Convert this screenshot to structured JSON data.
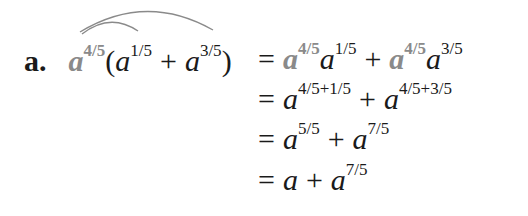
{
  "problem": {
    "label": "a.",
    "lhs": {
      "base": "a",
      "outer_exp": "4/5",
      "open_paren": "(",
      "term1_base": "a",
      "term1_exp": "1/5",
      "plus": "+",
      "term2_base": "a",
      "term2_exp": "3/5",
      "close_paren": ")"
    },
    "steps": [
      {
        "eq": "=",
        "parts": [
          {
            "base": "a",
            "exp": "4/5",
            "highlight": true
          },
          {
            "base": "a",
            "exp": "1/5"
          },
          {
            "op": "+"
          },
          {
            "base": "a",
            "exp": "4/5",
            "highlight": true
          },
          {
            "base": "a",
            "exp": "3/5"
          }
        ]
      },
      {
        "eq": "=",
        "parts": [
          {
            "base": "a",
            "exp": "4/5+1/5"
          },
          {
            "op": "+"
          },
          {
            "base": "a",
            "exp": "4/5+3/5"
          }
        ]
      },
      {
        "eq": "=",
        "parts": [
          {
            "base": "a",
            "exp": "5/5"
          },
          {
            "op": "+"
          },
          {
            "base": "a",
            "exp": "7/5"
          }
        ]
      },
      {
        "eq": "=",
        "parts": [
          {
            "base": "a"
          },
          {
            "op": "+"
          },
          {
            "base": "a",
            "exp": "7/5"
          }
        ]
      }
    ],
    "colors": {
      "text": "#1a1a1a",
      "highlight": "#8a8a8a",
      "arc": "#8a8a8a"
    }
  }
}
